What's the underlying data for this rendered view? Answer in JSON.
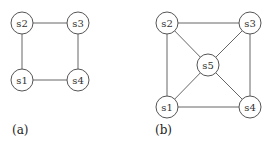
{
  "panels": [
    {
      "label": "(a)",
      "nodes": [
        {
          "id": "s1",
          "label": "s1",
          "x": 22,
          "y": 80
        },
        {
          "id": "s2",
          "label": "s2",
          "x": 22,
          "y": 23
        },
        {
          "id": "s3",
          "label": "s3",
          "x": 78,
          "y": 23
        },
        {
          "id": "s4",
          "label": "s4",
          "x": 78,
          "y": 80
        }
      ],
      "edges": [
        [
          "s1",
          "s2"
        ],
        [
          "s2",
          "s3"
        ],
        [
          "s3",
          "s4"
        ],
        [
          "s4",
          "s1"
        ]
      ]
    },
    {
      "label": "(b)",
      "nodes": [
        {
          "id": "s1",
          "label": "s1",
          "x": 167,
          "y": 107
        },
        {
          "id": "s2",
          "label": "s2",
          "x": 167,
          "y": 23
        },
        {
          "id": "s3",
          "label": "s3",
          "x": 250,
          "y": 23
        },
        {
          "id": "s4",
          "label": "s4",
          "x": 250,
          "y": 107
        },
        {
          "id": "s5",
          "label": "s5",
          "x": 208,
          "y": 65
        }
      ],
      "edges": [
        [
          "s1",
          "s2"
        ],
        [
          "s2",
          "s3"
        ],
        [
          "s3",
          "s4"
        ],
        [
          "s4",
          "s1"
        ],
        [
          "s5",
          "s1"
        ],
        [
          "s5",
          "s2"
        ],
        [
          "s5",
          "s3"
        ],
        [
          "s5",
          "s4"
        ]
      ]
    }
  ],
  "node_radius": 11
}
